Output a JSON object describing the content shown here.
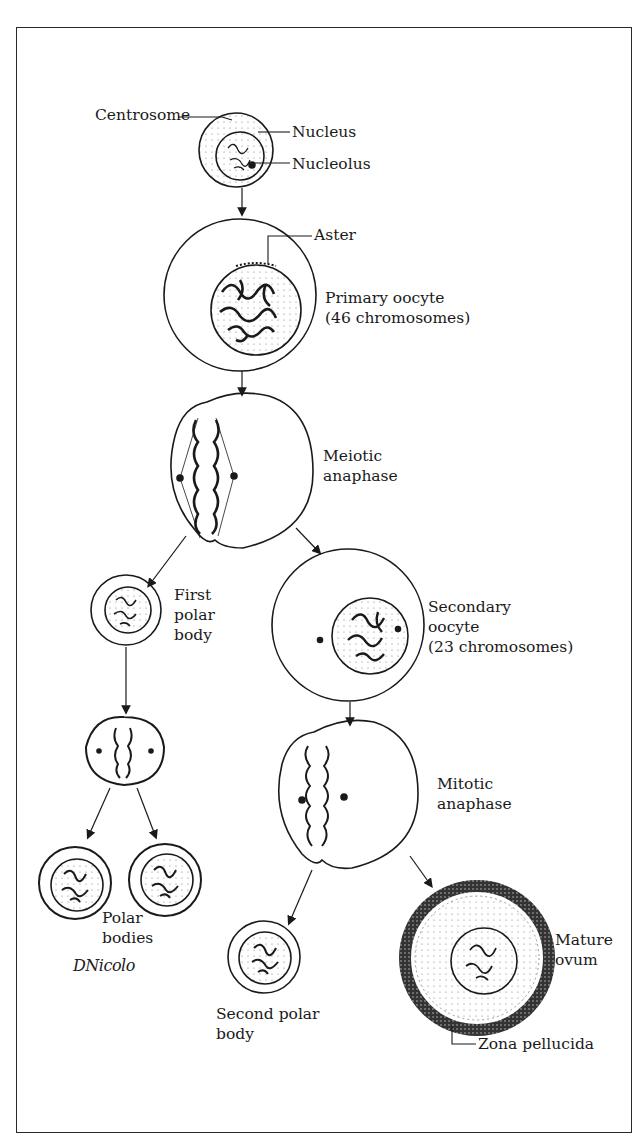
{
  "figure": {
    "stages": [
      {
        "id": "oogonium",
        "labels": [
          "Centrosome",
          "Nucleus",
          "Nucleolus"
        ]
      },
      {
        "id": "primary-oocyte",
        "labels": [
          "Aster",
          "Primary oocyte\n(46 chromosomes)"
        ]
      },
      {
        "id": "meiotic-anaphase",
        "labels": [
          "Meiotic\nanaphase"
        ]
      },
      {
        "id": "first-polar-body",
        "labels": [
          "First\npolar\nbody"
        ]
      },
      {
        "id": "secondary-oocyte",
        "labels": [
          "Secondary\noocyte\n(23 chromosomes)"
        ]
      },
      {
        "id": "polar-bodies",
        "labels": [
          "Polar\nbodies"
        ]
      },
      {
        "id": "mitotic-anaphase",
        "labels": [
          "Mitotic\nanaphase"
        ]
      },
      {
        "id": "second-polar-body",
        "labels": [
          "Second polar\nbody"
        ]
      },
      {
        "id": "mature-ovum",
        "labels": [
          "Mature\novum",
          "Zona pellucida"
        ]
      }
    ]
  },
  "labels": {
    "centrosome": "Centrosome",
    "nucleus": "Nucleus",
    "nucleolus": "Nucleolus",
    "aster": "Aster",
    "primary_oocyte": "Primary oocyte\n(46 chromosomes)",
    "meiotic_anaphase": "Meiotic\nanaphase",
    "first_polar_body": "First\npolar\nbody",
    "secondary_oocyte": "Secondary\noocyte\n(23 chromosomes)",
    "mitotic_anaphase": "Mitotic\nanaphase",
    "polar_bodies": "Polar\nbodies",
    "second_polar_body": "Second polar\nbody",
    "mature_ovum": "Mature\novum",
    "zona_pellucida": "Zona pellucida"
  },
  "signature": "DNicolo",
  "colors": {
    "ink": "#1a1a1a",
    "background": "#ffffff"
  }
}
